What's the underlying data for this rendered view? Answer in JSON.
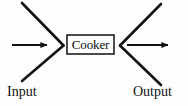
{
  "diagram": {
    "type": "process-flow",
    "title": "",
    "background_color": "#fdfdfd",
    "stroke_color": "#111111",
    "process": {
      "label": "Cooker",
      "shape": "rectangle",
      "border_color": "#111111",
      "fill_color": "#ffffff"
    },
    "labels": {
      "input": "Input",
      "output": "Output"
    },
    "connectors": {
      "input_arrow": {
        "name": "input-arrow",
        "direction": "right",
        "label": "Input"
      },
      "output_arrow": {
        "name": "output-arrow",
        "direction": "right",
        "label": "Output"
      },
      "input_chevron": {
        "name": "input-chevron",
        "orientation": "converging-right"
      },
      "output_chevron": {
        "name": "output-chevron",
        "orientation": "diverging-right"
      }
    }
  }
}
